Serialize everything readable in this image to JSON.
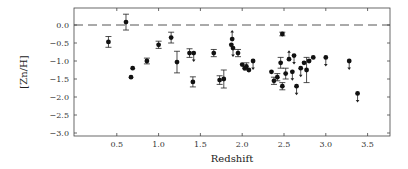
{
  "chart_data": {
    "type": "scatter",
    "title": "",
    "xlabel": "Redshift",
    "ylabel": "[Zn/H]",
    "xlim": [
      0.0,
      3.8
    ],
    "ylim": [
      -3.15,
      0.35
    ],
    "xticks": [
      0.5,
      1.0,
      1.5,
      2.0,
      2.5,
      3.0,
      3.5
    ],
    "xtick_labels": [
      "0.5",
      "1.0",
      "1.5",
      "2.0",
      "2.5",
      "3.0",
      "3.5"
    ],
    "yticks": [
      0.0,
      -0.5,
      -1.0,
      -1.5,
      -2.0,
      -2.5,
      -3.0
    ],
    "ytick_labels": [
      "0.0",
      "-0.5",
      "-1.0",
      "-1.5",
      "-2.0",
      "-2.5",
      "-3.0"
    ],
    "grid": false,
    "legend": null,
    "reference_line": {
      "y": 0.0,
      "style": "dashed",
      "label": "solar"
    },
    "series": [
      {
        "name": "measurements",
        "marker": "filled-circle",
        "points": [
          {
            "x": 0.4,
            "y": -0.47,
            "err": 0.15
          },
          {
            "x": 0.61,
            "y": 0.08,
            "err": 0.22
          },
          {
            "x": 0.69,
            "y": -1.2
          },
          {
            "x": 0.67,
            "y": -1.45
          },
          {
            "x": 0.86,
            "y": -1.0,
            "err": 0.08
          },
          {
            "x": 1.0,
            "y": -0.55,
            "err": 0.1
          },
          {
            "x": 1.15,
            "y": -0.35,
            "err": 0.15
          },
          {
            "x": 1.22,
            "y": -1.03,
            "err": 0.3
          },
          {
            "x": 1.37,
            "y": -0.78,
            "err": 0.12
          },
          {
            "x": 1.41,
            "y": -1.58,
            "err": 0.14
          },
          {
            "x": 1.66,
            "y": -0.78,
            "err": 0.1
          },
          {
            "x": 1.73,
            "y": -1.53,
            "err": 0.12
          },
          {
            "x": 1.78,
            "y": -1.5,
            "err": 0.25
          },
          {
            "x": 1.87,
            "y": -0.55
          },
          {
            "x": 1.95,
            "y": -0.78,
            "err": 0.1
          },
          {
            "x": 2.0,
            "y": -1.1
          },
          {
            "x": 2.03,
            "y": -1.2
          },
          {
            "x": 2.05,
            "y": -1.15,
            "err": 0.1
          },
          {
            "x": 2.08,
            "y": -1.25
          },
          {
            "x": 2.48,
            "y": -0.25,
            "err": 0.05
          },
          {
            "x": 2.46,
            "y": -1.05,
            "err": 0.15
          },
          {
            "x": 2.35,
            "y": -1.3
          },
          {
            "x": 2.38,
            "y": -1.55,
            "err": 0.1
          },
          {
            "x": 2.42,
            "y": -1.45,
            "err": 0.1
          },
          {
            "x": 2.52,
            "y": -1.35,
            "err": 0.15
          },
          {
            "x": 2.48,
            "y": -1.7,
            "err": 0.1
          },
          {
            "x": 2.74,
            "y": -1.05
          },
          {
            "x": 2.77,
            "y": -1.25,
            "err": 0.35
          },
          {
            "x": 2.8,
            "y": -1.0
          },
          {
            "x": 2.85,
            "y": -0.9
          }
        ]
      },
      {
        "name": "upper-limits",
        "marker": "filled-circle-with-down-arrow",
        "points": [
          {
            "x": 1.42,
            "y": -0.78
          },
          {
            "x": 1.89,
            "y": -0.64
          },
          {
            "x": 2.13,
            "y": -1.0
          },
          {
            "x": 2.6,
            "y": -1.3
          },
          {
            "x": 2.7,
            "y": -1.2
          },
          {
            "x": 2.65,
            "y": -1.7
          },
          {
            "x": 2.62,
            "y": -0.85
          },
          {
            "x": 3.0,
            "y": -0.9
          },
          {
            "x": 3.28,
            "y": -1.0
          },
          {
            "x": 3.38,
            "y": -1.9
          }
        ]
      },
      {
        "name": "lower-limits",
        "marker": "filled-circle-with-up-arrow",
        "points": [
          {
            "x": 1.88,
            "y": -0.39
          },
          {
            "x": 2.56,
            "y": -0.95
          }
        ]
      }
    ]
  }
}
